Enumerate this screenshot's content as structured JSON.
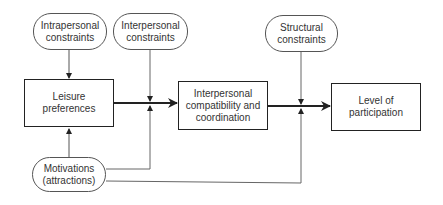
{
  "diagram": {
    "nodes": {
      "intrapersonal": {
        "label": "Intrapersonal\nconstraints",
        "shape": "oval"
      },
      "interpersonal": {
        "label": "Interpersonal\nconstraints",
        "shape": "oval"
      },
      "structural": {
        "label": "Structural\nconstraints",
        "shape": "oval"
      },
      "leisure": {
        "label": "Leisure\npreferences",
        "shape": "box"
      },
      "compatibility": {
        "label": "Interpersonal\ncompatibility and\ncoordination",
        "shape": "box"
      },
      "participation": {
        "label": "Level of\nparticipation",
        "shape": "box"
      },
      "motivations": {
        "label": "Motivations\n(attractions)",
        "shape": "oval"
      }
    },
    "edges": [
      {
        "from": "intrapersonal",
        "to": "leisure"
      },
      {
        "from": "motivations",
        "to": "leisure"
      },
      {
        "from": "leisure",
        "to": "compatibility"
      },
      {
        "from": "interpersonal",
        "to": "leisure-compatibility-link"
      },
      {
        "from": "motivations",
        "to": "leisure-compatibility-link"
      },
      {
        "from": "compatibility",
        "to": "participation"
      },
      {
        "from": "structural",
        "to": "compatibility-participation-link"
      },
      {
        "from": "motivations",
        "to": "compatibility-participation-link"
      }
    ],
    "colors": {
      "line": "#333333",
      "thin_line": "#666666",
      "background": "#ffffff"
    }
  }
}
